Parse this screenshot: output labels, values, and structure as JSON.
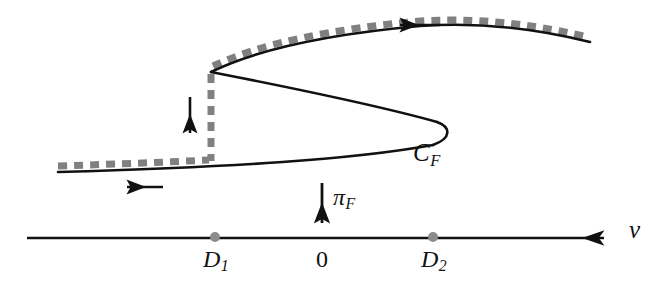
{
  "figure": {
    "type": "bifurcation-diagram",
    "colors": {
      "curve": "#111111",
      "dash_overlay": "#808080",
      "axis": "#111111",
      "marker_dot": "#8c8c8c",
      "background": "#ffffff"
    },
    "labels": {
      "curve_label": "C",
      "curve_label_sub": "F",
      "projection_label": "π",
      "projection_label_sub": "F",
      "axis_label": "v",
      "tick_d1": "D",
      "tick_d1_sub": "1",
      "tick_zero": "0",
      "tick_d2": "D",
      "tick_d2_sub": "2"
    },
    "axis": {
      "x_start": 27,
      "x_end": 612,
      "y": 238,
      "ticks": [
        {
          "name": "D1",
          "x": 215
        },
        {
          "name": "0",
          "x": 322,
          "dot": false
        },
        {
          "name": "D2",
          "x": 433
        }
      ]
    },
    "curve": {
      "upper_branch_path": "M 211 72 C 260 48 330 34 420 26 C 490 22 545 32 590 42",
      "middle_branch_path": "M 211 72 C 280 86 390 108 437 124",
      "fold_nose_path": "M 437 124 C 452 130 450 140 430 146",
      "lower_branch_path": "M 430 146 C 360 158 240 166 58 172",
      "fold_left_x": 211,
      "fold_left_y": 72,
      "fold_nose_x": 443,
      "fold_nose_y": 128
    },
    "dashed_overlay": {
      "upper_path": "M 213 66 C 262 43 332 29 420 21 C 490 17 545 27 588 37",
      "lower_path": "M 58 166 C 120 164 170 162 209 160",
      "vertical": {
        "x": 211,
        "y_top": 74,
        "y_bottom": 160
      },
      "dash_pattern": "9 7",
      "stroke_width": 7
    },
    "arrows": [
      {
        "name": "upper-flow-arrow",
        "direction": "left",
        "x1": 440,
        "y1": 25,
        "x2": 396,
        "y2": 25
      },
      {
        "name": "lower-flow-arrow",
        "direction": "left",
        "x1": 163,
        "y1": 187,
        "x2": 122,
        "y2": 187
      },
      {
        "name": "jump-arrow",
        "direction": "down",
        "x1": 190,
        "y1": 97,
        "x2": 190,
        "y2": 137
      },
      {
        "name": "projection-arrow",
        "direction": "down",
        "x1": 322,
        "y1": 183,
        "x2": 322,
        "y2": 227
      }
    ]
  }
}
